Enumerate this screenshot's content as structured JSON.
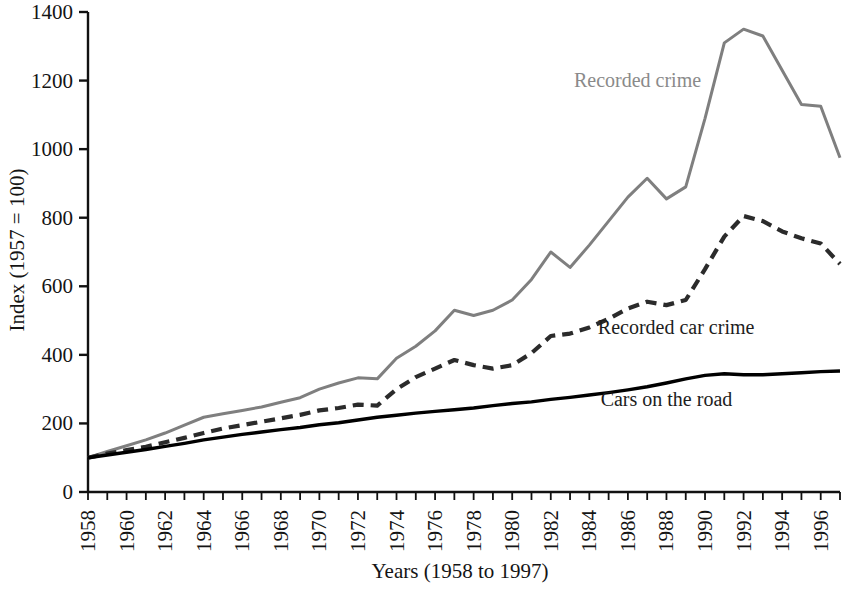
{
  "chart_data": {
    "type": "line",
    "title": "",
    "xlabel": "Years (1958 to 1997)",
    "ylabel": "Index (1957 = 100)",
    "xlim": [
      1958,
      1997
    ],
    "ylim": [
      0,
      1400
    ],
    "grid": false,
    "legend_position": "inline-annotations",
    "y_ticks": [
      0,
      200,
      400,
      600,
      800,
      1000,
      1200,
      1400
    ],
    "y_tick_labels": [
      "0",
      "200",
      "400",
      "600",
      "800",
      "1000",
      "1200",
      "1400"
    ],
    "x_ticks": [
      1958,
      1960,
      1962,
      1964,
      1966,
      1968,
      1970,
      1972,
      1974,
      1976,
      1978,
      1980,
      1982,
      1984,
      1986,
      1988,
      1990,
      1992,
      1994,
      1996
    ],
    "x_tick_labels": [
      "1958",
      "1960",
      "1962",
      "1964",
      "1966",
      "1968",
      "1970",
      "1972",
      "1974",
      "1976",
      "1978",
      "1980",
      "1982",
      "1984",
      "1986",
      "1988",
      "1990",
      "1992",
      "1994",
      "1996"
    ],
    "x": [
      1958,
      1959,
      1960,
      1961,
      1962,
      1963,
      1964,
      1965,
      1966,
      1967,
      1968,
      1969,
      1970,
      1971,
      1972,
      1973,
      1974,
      1975,
      1976,
      1977,
      1978,
      1979,
      1980,
      1981,
      1982,
      1983,
      1984,
      1985,
      1986,
      1987,
      1988,
      1989,
      1990,
      1991,
      1992,
      1993,
      1994,
      1995,
      1996,
      1997
    ],
    "series": [
      {
        "name": "Recorded crime",
        "color": "#7f7f7f",
        "style": "solid",
        "label": "Recorded crime",
        "values": [
          100,
          118,
          135,
          152,
          172,
          195,
          218,
          228,
          238,
          248,
          262,
          275,
          300,
          318,
          333,
          330,
          390,
          425,
          470,
          530,
          515,
          530,
          560,
          620,
          700,
          655,
          720,
          790,
          860,
          915,
          855,
          890,
          1090,
          1310,
          1350,
          1330,
          1230,
          1130,
          1125,
          975
        ]
      },
      {
        "name": "Recorded car crime",
        "color": "#2b2b2b",
        "style": "dashed",
        "label": "Recorded car crime",
        "values": [
          100,
          112,
          122,
          132,
          145,
          158,
          172,
          185,
          195,
          205,
          215,
          225,
          238,
          245,
          255,
          252,
          300,
          335,
          360,
          385,
          370,
          360,
          370,
          405,
          455,
          462,
          480,
          505,
          535,
          555,
          545,
          560,
          650,
          745,
          805,
          790,
          760,
          740,
          725,
          665
        ]
      },
      {
        "name": "Cars on the road",
        "color": "#000000",
        "style": "solid",
        "label": "Cars on the road",
        "values": [
          100,
          108,
          116,
          124,
          133,
          142,
          152,
          160,
          168,
          175,
          182,
          188,
          196,
          202,
          210,
          218,
          224,
          230,
          235,
          240,
          245,
          252,
          258,
          263,
          270,
          276,
          283,
          290,
          298,
          307,
          318,
          330,
          340,
          345,
          342,
          342,
          345,
          348,
          351,
          353
        ]
      }
    ],
    "annotations": [
      {
        "text": "Recorded crime",
        "x": 1986.5,
        "y": 1180,
        "color": "#8a8a8a"
      },
      {
        "text": "Recorded car crime",
        "x": 1988.5,
        "y": 460,
        "color": "#1d1d1d"
      },
      {
        "text": "Cars on the road",
        "x": 1988.0,
        "y": 250,
        "color": "#1d1d1d"
      }
    ]
  }
}
